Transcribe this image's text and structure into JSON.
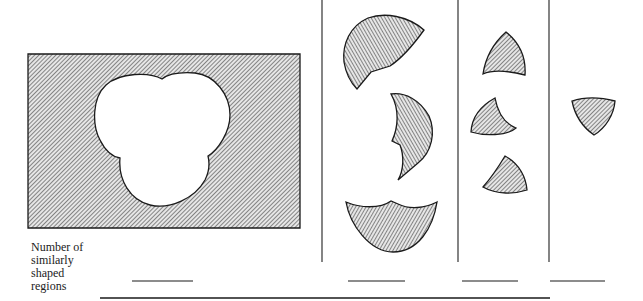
{
  "figure": {
    "row_label": [
      "Number of",
      "similarly",
      "shaped",
      "regions"
    ],
    "columns": [
      {
        "name": "rectangle-with-hole",
        "blank": ""
      },
      {
        "name": "large-lunes",
        "blank": ""
      },
      {
        "name": "curved-triangles",
        "blank": ""
      },
      {
        "name": "central-triangle",
        "blank": ""
      }
    ],
    "colors": {
      "stroke": "#1a1a1a",
      "hatch": "#333333",
      "fill_bg": "#d8d8d8"
    }
  }
}
